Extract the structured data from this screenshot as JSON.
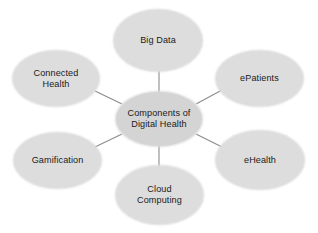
{
  "diagram": {
    "type": "hub-and-spoke concept map",
    "background_color": "#ffffff",
    "node_fill_color": "#dcdcdc",
    "center_node_fill_color": "#d4d4d4",
    "text_color": "#1a1a1a",
    "edge_color": "#8c8c8c",
    "center": {
      "id": "components-of-digital-health",
      "label": "Components of\nDigital Health"
    },
    "nodes": [
      {
        "id": "big-data",
        "label": "Big Data",
        "position": "top"
      },
      {
        "id": "epatients",
        "label": "ePatients",
        "position": "upper-right"
      },
      {
        "id": "ehealth",
        "label": "eHealth",
        "position": "lower-right"
      },
      {
        "id": "cloud-computing",
        "label": "Cloud\nComputing",
        "position": "bottom"
      },
      {
        "id": "gamification",
        "label": "Gamification",
        "position": "lower-left"
      },
      {
        "id": "connected-health",
        "label": "Connected\nHealth",
        "position": "upper-left"
      }
    ],
    "edges": [
      {
        "from": "components-of-digital-health",
        "to": "big-data"
      },
      {
        "from": "components-of-digital-health",
        "to": "epatients"
      },
      {
        "from": "components-of-digital-health",
        "to": "ehealth"
      },
      {
        "from": "components-of-digital-health",
        "to": "cloud-computing"
      },
      {
        "from": "components-of-digital-health",
        "to": "gamification"
      },
      {
        "from": "components-of-digital-health",
        "to": "connected-health"
      }
    ]
  }
}
